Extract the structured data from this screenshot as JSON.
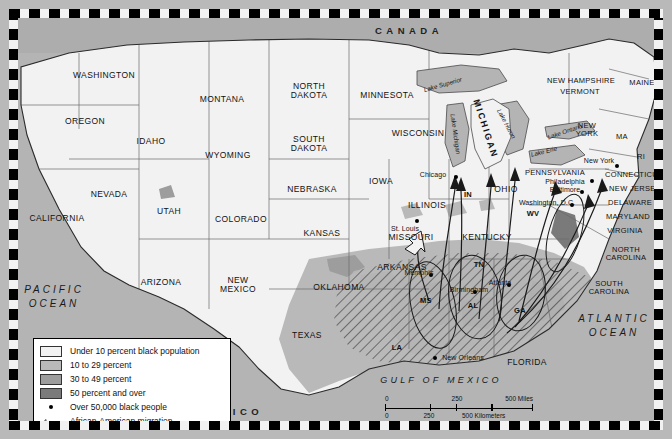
{
  "map": {
    "countries": [
      {
        "name": "CANADA",
        "x": 400,
        "y": 22
      },
      {
        "name": "MEXICO",
        "x": 222,
        "y": 403
      }
    ],
    "oceans": [
      {
        "lines": [
          "PACIFIC",
          "OCEAN"
        ],
        "x": 45,
        "y": 288
      },
      {
        "lines": [
          "ATLANTIC",
          "OCEAN"
        ],
        "x": 605,
        "y": 317
      },
      {
        "lines": [
          "GULF OF MEXICO"
        ],
        "x": 432,
        "y": 372
      }
    ],
    "lakes": [
      {
        "name": "Lake Superior",
        "x": 434,
        "y": 76,
        "rot": -16
      },
      {
        "name": "Lake Michigan",
        "x": 446,
        "y": 125,
        "rot": 82
      },
      {
        "name": "Lake Huron",
        "x": 497,
        "y": 115,
        "rot": 62
      },
      {
        "name": "Lake Erie",
        "x": 535,
        "y": 143,
        "rot": -14
      },
      {
        "name": "Lake Ontario",
        "x": 556,
        "y": 123,
        "rot": -19
      }
    ],
    "states": [
      {
        "name": "WASHINGTON",
        "x": 95,
        "y": 66,
        "cls": "st"
      },
      {
        "name": "OREGON",
        "x": 76,
        "y": 112,
        "cls": "st"
      },
      {
        "name": "IDAHO",
        "x": 142,
        "y": 132,
        "cls": "st"
      },
      {
        "name": "MONTANA",
        "x": 213,
        "y": 90,
        "cls": "st"
      },
      {
        "name": "WYOMING",
        "x": 219,
        "y": 146,
        "cls": "st"
      },
      {
        "name": "NEVADA",
        "x": 100,
        "y": 185,
        "cls": "st"
      },
      {
        "name": "UTAH",
        "x": 160,
        "y": 202,
        "cls": "st"
      },
      {
        "name": "CALIFORNIA",
        "x": 48,
        "y": 209,
        "cls": "st"
      },
      {
        "name": "COLORADO",
        "x": 232,
        "y": 210,
        "cls": "st"
      },
      {
        "name": "ARIZONA",
        "x": 152,
        "y": 273,
        "cls": "st"
      },
      {
        "name": "NEW MEXICO",
        "x": 229,
        "y": 280,
        "cls": "st"
      },
      {
        "name": "NORTH DAKOTA",
        "x": 300,
        "y": 86,
        "cls": "st"
      },
      {
        "name": "SOUTH DAKOTA",
        "x": 300,
        "y": 139,
        "cls": "st"
      },
      {
        "name": "NEBRASKA",
        "x": 303,
        "y": 180,
        "cls": "st"
      },
      {
        "name": "KANSAS",
        "x": 313,
        "y": 224,
        "cls": "st"
      },
      {
        "name": "OKLAHOMA",
        "x": 330,
        "y": 278,
        "cls": "st"
      },
      {
        "name": "TEXAS",
        "x": 298,
        "y": 326,
        "cls": "st"
      },
      {
        "name": "MINNESOTA",
        "x": 378,
        "y": 86,
        "cls": "st"
      },
      {
        "name": "IOWA",
        "x": 372,
        "y": 172,
        "cls": "st"
      },
      {
        "name": "WISCONSIN",
        "x": 409,
        "y": 124,
        "cls": "st"
      },
      {
        "name": "MISSOURI",
        "x": 402,
        "y": 228,
        "cls": "st"
      },
      {
        "name": "ARKANSAS",
        "x": 393,
        "y": 258,
        "cls": "st"
      },
      {
        "name": "ILLINOIS",
        "x": 418,
        "y": 196,
        "cls": "st"
      },
      {
        "name": "IN",
        "x": 459,
        "y": 186,
        "cls": "abbr"
      },
      {
        "name": "OHIO",
        "x": 497,
        "y": 180,
        "cls": "st"
      },
      {
        "name": "KENTUCKY",
        "x": 478,
        "y": 228,
        "cls": "st"
      },
      {
        "name": "TN",
        "x": 470,
        "y": 256,
        "cls": "abbr"
      },
      {
        "name": "MS",
        "x": 417,
        "y": 292,
        "cls": "abbr"
      },
      {
        "name": "AL",
        "x": 464,
        "y": 297,
        "cls": "abbr"
      },
      {
        "name": "GA",
        "x": 511,
        "y": 302,
        "cls": "abbr"
      },
      {
        "name": "LA",
        "x": 388,
        "y": 339,
        "cls": "abbr"
      },
      {
        "name": "FLORIDA",
        "x": 518,
        "y": 353,
        "cls": "st"
      },
      {
        "name": "WV",
        "x": 524,
        "y": 205,
        "cls": "abbr"
      },
      {
        "name": "MICHIGAN",
        "x": 476,
        "y": 120,
        "cls": "mich"
      },
      {
        "name": "NEW HAMPSHIRE",
        "x": 572,
        "y": 72,
        "cls": "st2"
      },
      {
        "name": "VERMONT",
        "x": 571,
        "y": 83,
        "cls": "st2"
      },
      {
        "name": "MAINE",
        "x": 633,
        "y": 74,
        "cls": "st2"
      },
      {
        "name": "NEW YORK",
        "x": 578,
        "y": 125,
        "cls": "st2"
      },
      {
        "name": "MA",
        "x": 613,
        "y": 128,
        "cls": "st2"
      },
      {
        "name": "RI",
        "x": 632,
        "y": 148,
        "cls": "st2"
      },
      {
        "name": "CONNECTICUT",
        "x": 625,
        "y": 166,
        "cls": "st2"
      },
      {
        "name": "PENNSYLVANIA",
        "x": 546,
        "y": 164,
        "cls": "st2"
      },
      {
        "name": "NEW JERSEY",
        "x": 626,
        "y": 180,
        "cls": "st2"
      },
      {
        "name": "DELAWARE",
        "x": 621,
        "y": 194,
        "cls": "st2"
      },
      {
        "name": "MARYLAND",
        "x": 619,
        "y": 208,
        "cls": "st2"
      },
      {
        "name": "VIRGINIA",
        "x": 616,
        "y": 222,
        "cls": "st2"
      },
      {
        "name": "NORTH CAROLINA",
        "x": 617,
        "y": 249,
        "cls": "st2"
      },
      {
        "name": "SOUTH CAROLINA",
        "x": 600,
        "y": 283,
        "cls": "st2"
      }
    ],
    "states_two_line": [
      {
        "line1": "NORTH",
        "line2": "DAKOTA",
        "x": 300,
        "y": 82
      },
      {
        "line1": "SOUTH",
        "line2": "DAKOTA",
        "x": 300,
        "y": 135
      },
      {
        "line1": "NEW",
        "line2": "MEXICO",
        "x": 229,
        "y": 276
      },
      {
        "line1": "NEW",
        "line2": "YORK",
        "x": 578,
        "y": 121
      },
      {
        "line1": "NORTH",
        "line2": "CAROLINA",
        "x": 617,
        "y": 245
      },
      {
        "line1": "SOUTH",
        "line2": "CAROLINA",
        "x": 600,
        "y": 279
      }
    ],
    "cities": [
      {
        "name": "Chicago",
        "x": 447,
        "y": 168,
        "lx": 424,
        "ly": 166
      },
      {
        "name": "St. Louis",
        "x": 408,
        "y": 212,
        "lx": 396,
        "ly": 220
      },
      {
        "name": "Memphis",
        "x": 422,
        "y": 266,
        "lx": 410,
        "ly": 264
      },
      {
        "name": "Birmingham",
        "x": 466,
        "y": 283,
        "lx": 460,
        "ly": 281
      },
      {
        "name": "Atlanta",
        "x": 500,
        "y": 276,
        "lx": 491,
        "ly": 274
      },
      {
        "name": "New Orleans",
        "x": 426,
        "y": 349,
        "lx": 444,
        "ly": 349
      },
      {
        "name": "Washington, D.C.",
        "x": 563,
        "y": 196,
        "lx": 546,
        "ly": 194
      },
      {
        "name": "Baltimore",
        "x": 573,
        "y": 183,
        "lx": 562,
        "ly": 181
      },
      {
        "name": "Philadelphia",
        "x": 583,
        "y": 172,
        "lx": 561,
        "ly": 173
      },
      {
        "name": "New York",
        "x": 608,
        "y": 157,
        "lx": 592,
        "ly": 152
      }
    ]
  },
  "legend": {
    "items": [
      {
        "label": "Under 10 percent black population",
        "color": "#f2f2f2",
        "type": "swatch"
      },
      {
        "label": "10 to 29 percent",
        "color": "#b9b9b9",
        "type": "swatch"
      },
      {
        "label": "30 to 49 percent",
        "color": "#9d9d9d",
        "type": "swatch"
      },
      {
        "label": "50 percent and over",
        "color": "#7a7a7a",
        "type": "swatch"
      },
      {
        "label": "Over 50,000 black people",
        "type": "dot"
      },
      {
        "label": "African-American migration",
        "type": "arrow"
      }
    ]
  },
  "scale": {
    "miles_labels": [
      "0",
      "250",
      "500 Miles"
    ],
    "km_labels": [
      "0",
      "250",
      "500 Kilometers"
    ]
  },
  "colors": {
    "under10": "#f2f2f2",
    "pct10_29": "#b9b9b9",
    "pct30_49": "#9d9d9d",
    "pct50plus": "#7a7a7a",
    "water": "#b4b4b4",
    "canada": "#adadad"
  }
}
